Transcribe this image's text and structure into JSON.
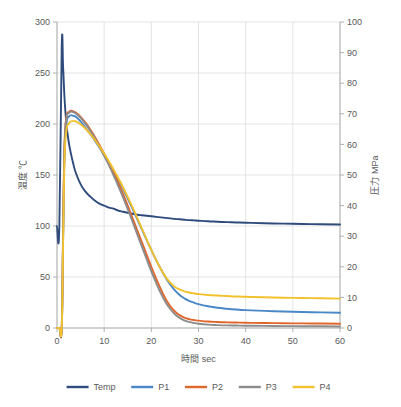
{
  "chart_data": {
    "type": "line",
    "title": "",
    "xlabel": "時間  sec",
    "ylabel": "温度  ℃",
    "y2label": "圧力  MPa",
    "xlim": [
      0,
      60
    ],
    "ylim": [
      0,
      300
    ],
    "y2lim": [
      0,
      100
    ],
    "xticks": [
      0,
      10,
      20,
      30,
      40,
      50,
      60
    ],
    "yticks": [
      0,
      50,
      100,
      150,
      200,
      250,
      300
    ],
    "y2ticks": [
      0,
      10,
      20,
      30,
      40,
      50,
      60,
      70,
      80,
      90,
      100
    ],
    "grid": true,
    "legend_position": "bottom",
    "x": [
      0,
      0.5,
      1,
      1.3,
      1.6,
      2,
      2.5,
      3,
      3.5,
      4,
      5,
      6,
      7,
      8,
      9,
      10,
      11,
      12,
      13,
      14,
      15,
      16,
      17,
      18,
      19,
      20,
      21,
      22,
      23,
      24,
      25,
      26,
      27,
      28,
      29,
      30,
      32,
      34,
      36,
      38,
      40,
      44,
      48,
      52,
      56,
      60
    ],
    "series": [
      {
        "name": "Temp",
        "axis": "left",
        "unit": "℃",
        "color": "#2E4B7C",
        "values": [
          100,
          100,
          275,
          255,
          225,
          200,
          182,
          170,
          160,
          152,
          141,
          134,
          129,
          125,
          122,
          120,
          118,
          117,
          115,
          114,
          113,
          112,
          111,
          110.5,
          110,
          109.5,
          109,
          108.5,
          108,
          107.5,
          107,
          106.6,
          106.2,
          105.8,
          105.5,
          105.2,
          104.6,
          104.2,
          103.8,
          103.5,
          103.2,
          102.7,
          102.3,
          102,
          101.7,
          101.5
        ]
      },
      {
        "name": "P1",
        "axis": "right",
        "unit": "MPa",
        "color": "#4A87C6",
        "values": [
          0,
          0,
          0,
          30,
          58,
          67,
          69,
          69.5,
          69.3,
          69,
          67.5,
          65.5,
          63.5,
          61.3,
          59,
          56.5,
          54,
          51.3,
          48.5,
          45.5,
          42.3,
          39,
          35.6,
          32.2,
          28.8,
          25.5,
          22.3,
          19.3,
          16.6,
          14.2,
          12.3,
          10.8,
          9.7,
          8.9,
          8.3,
          7.8,
          7.1,
          6.6,
          6.3,
          6.05,
          5.85,
          5.6,
          5.4,
          5.25,
          5.1,
          5.0
        ]
      },
      {
        "name": "P2",
        "axis": "right",
        "unit": "MPa",
        "color": "#E0662B",
        "values": [
          0,
          0,
          0,
          32,
          60,
          69,
          70.5,
          71,
          70.8,
          70.4,
          69,
          67.2,
          65,
          62.5,
          59.8,
          57,
          54,
          50.8,
          47.4,
          43.8,
          40,
          36,
          32,
          28,
          24,
          20,
          16.2,
          12.7,
          9.6,
          7.2,
          5.4,
          4.2,
          3.4,
          2.9,
          2.6,
          2.4,
          2.1,
          1.95,
          1.85,
          1.78,
          1.72,
          1.62,
          1.55,
          1.5,
          1.45,
          1.4
        ]
      },
      {
        "name": "P3",
        "axis": "right",
        "unit": "MPa",
        "color": "#8C8C8C",
        "values": [
          0,
          0,
          0,
          31,
          59,
          68.5,
          70.2,
          70.7,
          70.5,
          70.1,
          68.7,
          66.8,
          64.6,
          62,
          59.2,
          56.3,
          53.2,
          49.9,
          46.4,
          42.7,
          38.8,
          34.8,
          30.7,
          26.6,
          22.5,
          18.5,
          14.8,
          11.4,
          8.5,
          6.2,
          4.5,
          3.3,
          2.5,
          2.0,
          1.65,
          1.4,
          1.1,
          0.95,
          0.85,
          0.8,
          0.75,
          0.68,
          0.62,
          0.58,
          0.55,
          0.5
        ]
      },
      {
        "name": "P4",
        "axis": "right",
        "unit": "MPa",
        "color": "#F2C12E",
        "values": [
          0,
          0,
          0,
          28,
          55,
          64.5,
          66.8,
          67.5,
          67.6,
          67.5,
          66.6,
          65.2,
          63.5,
          61.5,
          59.3,
          57,
          54.5,
          51.8,
          49,
          46,
          42.8,
          39.5,
          36,
          32.5,
          29,
          25.5,
          22.3,
          19.3,
          16.8,
          14.8,
          13.4,
          12.6,
          12.0,
          11.6,
          11.3,
          11.1,
          10.8,
          10.6,
          10.45,
          10.3,
          10.2,
          10.05,
          9.9,
          9.8,
          9.7,
          9.6
        ]
      }
    ],
    "legend": [
      {
        "label": "Temp",
        "color": "#2E4B7C"
      },
      {
        "label": "P1",
        "color": "#4A87C6"
      },
      {
        "label": "P2",
        "color": "#E0662B"
      },
      {
        "label": "P3",
        "color": "#8C8C8C"
      },
      {
        "label": "P4",
        "color": "#F2C12E"
      }
    ]
  }
}
